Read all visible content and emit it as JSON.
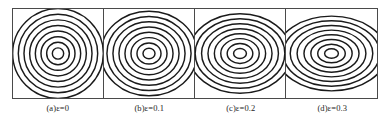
{
  "figure": {
    "title": "",
    "panel_count": 4,
    "frame_color": "#4a4a4a",
    "contour_color": "#1a1a1a",
    "background_color": "#ffffff"
  },
  "panels": [
    {
      "id": "panel-a",
      "caption": "(a)ε=0",
      "label": "(a)",
      "parameter_symbol": "ε",
      "parameter_value": "0",
      "eccentricity": 0
    },
    {
      "id": "panel-b",
      "caption": "(b)ε=0.1",
      "label": "(b)",
      "parameter_symbol": "ε",
      "parameter_value": "0.1",
      "eccentricity": 0.1
    },
    {
      "id": "panel-c",
      "caption": "(c)ε=0.2",
      "label": "(c)",
      "parameter_symbol": "ε",
      "parameter_value": "0.2",
      "eccentricity": 0.2
    },
    {
      "id": "panel-d",
      "caption": "(d)ε=0.3",
      "label": "(d)",
      "parameter_symbol": "ε",
      "parameter_value": "0.3",
      "eccentricity": 0.3
    }
  ],
  "chart_data": {
    "type": "line",
    "title": "",
    "xlabel": "",
    "ylabel": "",
    "subtitle": "",
    "grid": false,
    "legend_position": "none",
    "panel_layout": {
      "rows": 1,
      "cols": 4
    },
    "axis_ranges": {
      "x": [
        -1,
        1
      ],
      "y": [
        -1,
        1
      ]
    },
    "series": [
      {
        "name": "(a)ε=0",
        "eccentricity": 0,
        "center": [
          0,
          0
        ],
        "contour_levels": [
          0.14,
          0.28,
          0.42,
          0.56,
          0.7,
          0.84,
          0.98,
          1.12
        ],
        "semi_axis_ratio": 1.0
      },
      {
        "name": "(b)ε=0.1",
        "eccentricity": 0.1,
        "center": [
          0,
          0
        ],
        "contour_levels": [
          0.14,
          0.28,
          0.42,
          0.56,
          0.7,
          0.84,
          0.98,
          1.12
        ],
        "semi_axis_ratio": 1.06
      },
      {
        "name": "(c)ε=0.2",
        "eccentricity": 0.2,
        "center": [
          0,
          0
        ],
        "contour_levels": [
          0.14,
          0.28,
          0.42,
          0.56,
          0.7,
          0.84,
          0.98,
          1.12
        ],
        "semi_axis_ratio": 1.13
      },
      {
        "name": "(d)ε=0.3",
        "eccentricity": 0.3,
        "center": [
          0,
          0
        ],
        "contour_levels": [
          0.14,
          0.28,
          0.42,
          0.56,
          0.7,
          0.84,
          0.98,
          1.12
        ],
        "semi_axis_ratio": 1.2
      }
    ],
    "categories": [
      "(a)ε=0",
      "(b)ε=0.1",
      "(c)ε=0.2",
      "(d)ε=0.3"
    ],
    "values": [
      0,
      0.1,
      0.2,
      0.3
    ]
  }
}
